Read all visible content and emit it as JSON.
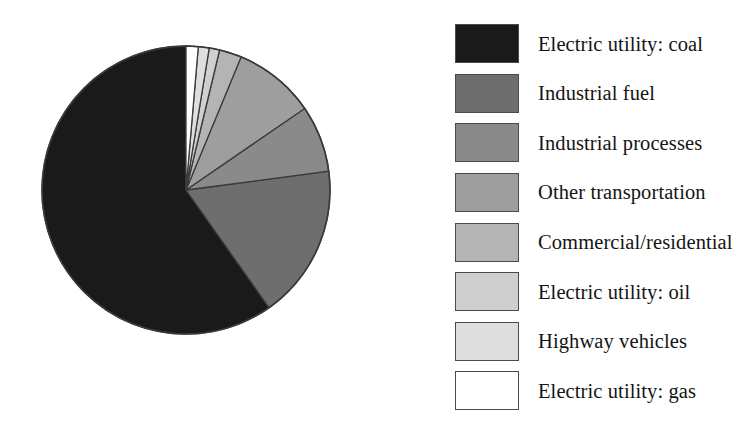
{
  "chart_data": {
    "type": "pie",
    "title": "",
    "legend_position": "right",
    "start_angle_deg": 0,
    "direction": "clockwise",
    "categories": [
      "Electric utility: coal",
      "Industrial fuel",
      "Industrial processes",
      "Other transportation",
      "Commercial/residential",
      "Electric utility: oil",
      "Highway vehicles",
      "Electric utility: gas"
    ],
    "values": [
      59.8,
      17.4,
      7.5,
      9.2,
      2.5,
      1.2,
      0.9,
      1.5
    ],
    "value_unit": "percent",
    "colors": [
      "#1a1a1a",
      "#6e6e6e",
      "#8a8a8a",
      "#9e9e9e",
      "#b4b4b4",
      "#cfcfcf",
      "#dedede",
      "#ffffff"
    ],
    "slices": [
      {
        "label": "Electric utility: coal",
        "value": 59.8,
        "color": "#1a1a1a",
        "start_deg": 144.8,
        "end_deg": 360.0
      },
      {
        "label": "Industrial fuel",
        "value": 17.4,
        "color": "#6e6e6e",
        "start_deg": 82.5,
        "end_deg": 144.8
      },
      {
        "label": "Industrial processes",
        "value": 7.5,
        "color": "#8a8a8a",
        "start_deg": 55.5,
        "end_deg": 82.5
      },
      {
        "label": "Other transportation",
        "value": 9.2,
        "color": "#9e9e9e",
        "start_deg": 22.5,
        "end_deg": 55.5
      },
      {
        "label": "Commercial/residential",
        "value": 2.5,
        "color": "#b4b4b4",
        "start_deg": 13.5,
        "end_deg": 22.5
      },
      {
        "label": "Electric utility: oil",
        "value": 1.2,
        "color": "#cfcfcf",
        "start_deg": 9.3,
        "end_deg": 13.5
      },
      {
        "label": "Highway vehicles",
        "value": 0.9,
        "color": "#dedede",
        "start_deg": 4.9,
        "end_deg": 9.3
      },
      {
        "label": "Electric utility: gas",
        "value": 1.5,
        "color": "#ffffff",
        "start_deg": 0.0,
        "end_deg": 4.9
      }
    ],
    "geometry": {
      "center_x": 186,
      "center_y": 190,
      "radius": 144,
      "outline_color": "#3a3a3a"
    }
  },
  "legend": {
    "items": [
      {
        "label": "Electric utility: coal",
        "color": "#1a1a1a"
      },
      {
        "label": "Industrial fuel",
        "color": "#6e6e6e"
      },
      {
        "label": "Industrial processes",
        "color": "#8a8a8a"
      },
      {
        "label": "Other transportation",
        "color": "#9e9e9e"
      },
      {
        "label": "Commercial/residential",
        "color": "#b4b4b4"
      },
      {
        "label": "Electric utility: oil",
        "color": "#cfcfcf"
      },
      {
        "label": "Highway vehicles",
        "color": "#dedede"
      },
      {
        "label": "Electric utility: gas",
        "color": "#ffffff"
      }
    ]
  }
}
